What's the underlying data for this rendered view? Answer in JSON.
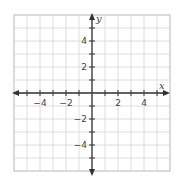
{
  "diagram": {
    "type": "coordinate-plane",
    "x_axis_label": "x",
    "y_axis_label": "y",
    "x_range": [
      -6,
      6
    ],
    "y_range": [
      -6,
      6
    ],
    "grid_step": 1,
    "x_tick_labels": [
      {
        "value": -4,
        "text": "−4"
      },
      {
        "value": -2,
        "text": "−2"
      },
      {
        "value": 2,
        "text": "2"
      },
      {
        "value": 4,
        "text": "4"
      }
    ],
    "y_tick_labels": [
      {
        "value": 4,
        "text": "4"
      },
      {
        "value": 2,
        "text": "2"
      },
      {
        "value": -2,
        "text": "−2"
      },
      {
        "value": -4,
        "text": "−4"
      }
    ],
    "colors": {
      "grid": "#dedede",
      "border": "#c8c8c8",
      "axis": "#333333",
      "label": "#444444"
    }
  }
}
